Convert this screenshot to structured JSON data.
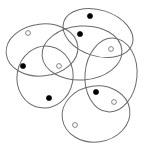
{
  "diagram": {
    "title": "",
    "colors": {
      "background": "#ffffff",
      "ellipse_stroke": "#6b6b6b",
      "filled_point": "#000000",
      "hollow_point_stroke": "#777777"
    },
    "sets": [
      {
        "id": "top-left"
      },
      {
        "id": "top-right"
      },
      {
        "id": "center"
      },
      {
        "id": "left-lower"
      },
      {
        "id": "right-tall"
      },
      {
        "id": "bottom"
      }
    ],
    "points": [
      {
        "id": "p1",
        "type": "hollow"
      },
      {
        "id": "p2",
        "type": "filled"
      },
      {
        "id": "p3",
        "type": "hollow"
      },
      {
        "id": "p4",
        "type": "filled"
      },
      {
        "id": "p5",
        "type": "filled"
      },
      {
        "id": "p6",
        "type": "hollow"
      },
      {
        "id": "p7",
        "type": "filled"
      },
      {
        "id": "p8",
        "type": "filled"
      },
      {
        "id": "p9",
        "type": "hollow"
      },
      {
        "id": "p10",
        "type": "hollow"
      }
    ]
  }
}
